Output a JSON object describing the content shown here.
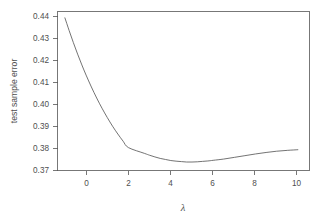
{
  "chart_data": {
    "type": "line",
    "title": "",
    "xlabel": "λ",
    "ylabel": "test sample error",
    "xlim": [
      -1.35,
      10.55
    ],
    "ylim": [
      0.3665,
      0.4415
    ],
    "xticks": [
      0,
      2,
      4,
      6,
      8,
      10
    ],
    "xtick_labels": [
      "0",
      "2",
      "4",
      "6",
      "8",
      "10"
    ],
    "yticks": [
      0.37,
      0.38,
      0.39,
      0.4,
      0.41,
      0.42,
      0.43,
      0.44
    ],
    "ytick_labels": [
      "0.37",
      "0.38",
      "0.39",
      "0.40",
      "0.41",
      "0.42",
      "0.43",
      "0.44"
    ],
    "grid": false,
    "legend": false,
    "series": [
      {
        "name": "test sample error",
        "x": [
          -1.0,
          -0.8,
          -0.6,
          -0.4,
          -0.2,
          0.0,
          0.25,
          0.5,
          0.75,
          1.0,
          1.25,
          1.5,
          1.75,
          2.0,
          2.25,
          2.5,
          2.75,
          3.0,
          3.25,
          3.5,
          3.75,
          4.0,
          4.25,
          4.5,
          4.75,
          5.0,
          5.25,
          5.5,
          5.75,
          6.0,
          6.5,
          7.0,
          7.5,
          8.0,
          8.5,
          9.0,
          9.5,
          10.0
        ],
        "values": [
          0.4385,
          0.4325,
          0.4268,
          0.4214,
          0.4163,
          0.4115,
          0.4059,
          0.4007,
          0.3959,
          0.3915,
          0.3874,
          0.3837,
          0.3803,
          0.3773,
          0.3628,
          0.3748,
          0.3746,
          0.3737,
          0.3729,
          0.3722,
          0.3717,
          0.3712,
          0.3709,
          0.3707,
          0.3705,
          0.3705,
          0.3706,
          0.3708,
          0.371,
          0.3713,
          0.3719,
          0.3727,
          0.3735,
          0.3743,
          0.375,
          0.3756,
          0.376,
          0.3763
        ]
      }
    ],
    "line_color": "#5a5a5a",
    "axis_color": "#555555",
    "background_color": "#ffffff",
    "x_start": -1.0,
    "x_end": 10.0,
    "minimum": {
      "x": 4.9,
      "y": 0.3705
    }
  },
  "axes": {
    "y_label": "test sample error",
    "x_label": "λ"
  }
}
